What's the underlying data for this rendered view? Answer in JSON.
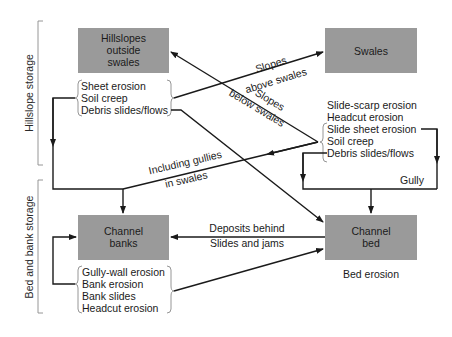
{
  "boxes": {
    "hillslopes": {
      "line1": "Hillslopes",
      "line2": "outside",
      "line3": "swales"
    },
    "swales": {
      "label": "Swales"
    },
    "channel_banks": {
      "line1": "Channel",
      "line2": "banks"
    },
    "channel_bed": {
      "line1": "Channel",
      "line2": "bed"
    }
  },
  "storage_labels": {
    "hillslope": "Hillslope storage",
    "bed_bank": "Bed and bank storage"
  },
  "processes": {
    "hillslope": [
      "Sheet erosion",
      "Soil creep",
      "Debris slides/flows"
    ],
    "swales": [
      "Slide-scarp erosion",
      "Headcut erosion",
      "Slide sheet erosion",
      "Soil creep",
      "Debris slides/flows"
    ],
    "banks": [
      "Gully-wall erosion",
      "Bank erosion",
      "Bank slides",
      "Headcut erosion"
    ],
    "bed": "Bed erosion"
  },
  "arrow_labels": {
    "slopes_above_1": "Slopes",
    "slopes_above_2": "above swales",
    "slopes_below_1": "Slopes",
    "slopes_below_2": "below swales",
    "including_1": "Including gullies",
    "including_2": "in swales",
    "deposits_1": "Deposits behind",
    "deposits_2": "Slides and jams",
    "gully": "Gully"
  },
  "colors": {
    "box_fill": "#9a9a9a",
    "line": "#1a1a1a",
    "background": "#ffffff"
  }
}
